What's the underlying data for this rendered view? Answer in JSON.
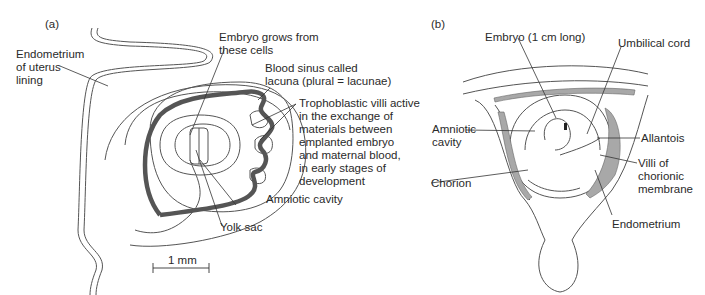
{
  "panel_a": {
    "tag": "(a)",
    "labels": {
      "endometrium": "Endometrium\nof uterus\nlining",
      "embryo_grows": "Embryo grows from\nthese cells",
      "blood_sinus": "Blood sinus called\nlacuna (plural = lacunae)",
      "trophoblastic": "Trophoblastic villi active\nin the exchange of\nmaterials between\nemplanted embryo\nand maternal blood,\nin early stages of\ndevelopment",
      "amniotic_cavity": "Amniotic cavity",
      "yolk_sac": "Yolk sac"
    },
    "scale_bar": "1 mm"
  },
  "panel_b": {
    "tag": "(b)",
    "labels": {
      "embryo": "Embryo (1 cm long)",
      "umbilical_cord": "Umbilical cord",
      "amniotic_cavity": "Amniotic\ncavity",
      "allantois": "Allantois",
      "chorion": "Chorion",
      "villi": "Villi of\nchorionic\nmembrane",
      "endometrium": "Endometrium"
    }
  },
  "colors": {
    "line": "#444444",
    "thick_line": "#555555",
    "shade": "#a8a8a8"
  }
}
